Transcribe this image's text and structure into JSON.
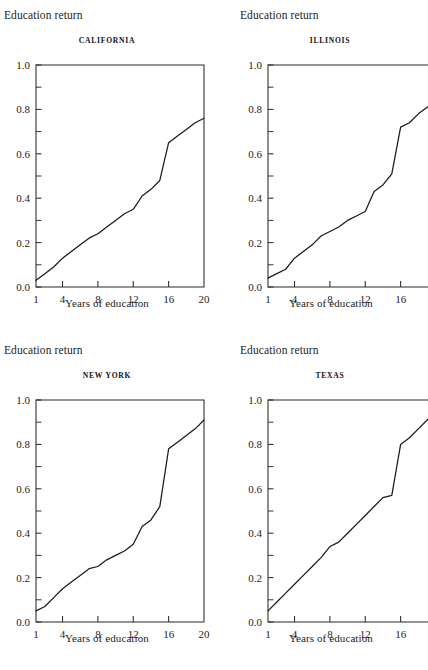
{
  "figure": {
    "panel_count": 4,
    "background_color": "#ffffff",
    "line_color": "#1a1a1a",
    "axis_color": "#2b2b2b"
  },
  "labels": {
    "ylabel": "Education return",
    "xlabel": "Years of education"
  },
  "axes": {
    "ylim": [
      0.0,
      1.0
    ],
    "xlim": [
      1,
      20
    ],
    "ytick_labels": [
      "0.0",
      "0.2",
      "0.4",
      "0.6",
      "0.8",
      "1.0"
    ],
    "ytick_values": [
      0.0,
      0.2,
      0.4,
      0.6,
      0.8,
      1.0
    ],
    "yminor_values": [
      0.1,
      0.3,
      0.5,
      0.7,
      0.9
    ],
    "xtick_labels": [
      "1",
      "4",
      "8",
      "12",
      "16",
      "20"
    ],
    "xtick_values": [
      1,
      4,
      8,
      12,
      16,
      20
    ],
    "grid": false,
    "legend": "none"
  },
  "chart_data": [
    {
      "type": "line",
      "title": "CALIFORNIA",
      "xlabel": "Years of education",
      "ylabel": "Education return",
      "xlim": [
        1,
        20
      ],
      "ylim": [
        0.0,
        1.0
      ],
      "grid": false,
      "legend": "none",
      "x": [
        1,
        2,
        3,
        4,
        5,
        6,
        7,
        8,
        9,
        10,
        11,
        12,
        13,
        14,
        15,
        16,
        17,
        18,
        19,
        20
      ],
      "y": [
        0.03,
        0.06,
        0.09,
        0.13,
        0.16,
        0.19,
        0.22,
        0.24,
        0.27,
        0.3,
        0.33,
        0.35,
        0.41,
        0.44,
        0.48,
        0.65,
        0.68,
        0.71,
        0.74,
        0.76
      ]
    },
    {
      "type": "line",
      "title": "ILLINOIS",
      "xlabel": "Years of education",
      "ylabel": "Education return",
      "xlim": [
        1,
        20
      ],
      "ylim": [
        0.0,
        1.0
      ],
      "grid": false,
      "legend": "none",
      "x": [
        1,
        2,
        3,
        4,
        5,
        6,
        7,
        8,
        9,
        10,
        11,
        12,
        13,
        14,
        15,
        16,
        17,
        18,
        19,
        20
      ],
      "y": [
        0.04,
        0.06,
        0.08,
        0.13,
        0.16,
        0.19,
        0.23,
        0.25,
        0.27,
        0.3,
        0.32,
        0.34,
        0.43,
        0.46,
        0.51,
        0.72,
        0.74,
        0.78,
        0.81,
        0.84
      ]
    },
    {
      "type": "line",
      "title": "NEW YORK",
      "xlabel": "Years of education",
      "ylabel": "Education return",
      "xlim": [
        1,
        20
      ],
      "ylim": [
        0.0,
        1.0
      ],
      "grid": false,
      "legend": "none",
      "x": [
        1,
        2,
        3,
        4,
        5,
        6,
        7,
        8,
        9,
        10,
        11,
        12,
        13,
        14,
        15,
        16,
        17,
        18,
        19,
        20
      ],
      "y": [
        0.05,
        0.07,
        0.11,
        0.15,
        0.18,
        0.21,
        0.24,
        0.25,
        0.28,
        0.3,
        0.32,
        0.35,
        0.43,
        0.46,
        0.52,
        0.78,
        0.81,
        0.84,
        0.87,
        0.91
      ]
    },
    {
      "type": "line",
      "title": "TEXAS",
      "xlabel": "Years of education",
      "ylabel": "Education return",
      "xlim": [
        1,
        20
      ],
      "ylim": [
        0.0,
        1.0
      ],
      "grid": false,
      "legend": "none",
      "x": [
        1,
        2,
        3,
        4,
        5,
        6,
        7,
        8,
        9,
        10,
        11,
        12,
        13,
        14,
        15,
        16,
        17,
        18,
        19,
        20
      ],
      "y": [
        0.05,
        0.09,
        0.13,
        0.17,
        0.21,
        0.25,
        0.29,
        0.34,
        0.36,
        0.4,
        0.44,
        0.48,
        0.52,
        0.56,
        0.57,
        0.8,
        0.83,
        0.87,
        0.91,
        0.95
      ]
    }
  ]
}
